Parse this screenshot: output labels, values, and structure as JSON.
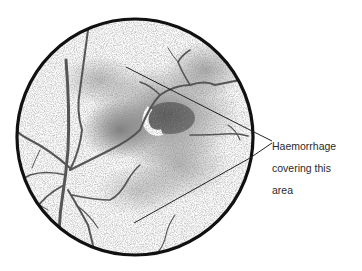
{
  "figure": {
    "annotation": {
      "line1": "Haemorrhage",
      "line2": "covering this",
      "line3": "area"
    }
  },
  "colors": {
    "background": "#ffffff",
    "outline": "#111111",
    "vessel": "#555555",
    "stipple": "#666666",
    "text": "#2a2a2a"
  }
}
